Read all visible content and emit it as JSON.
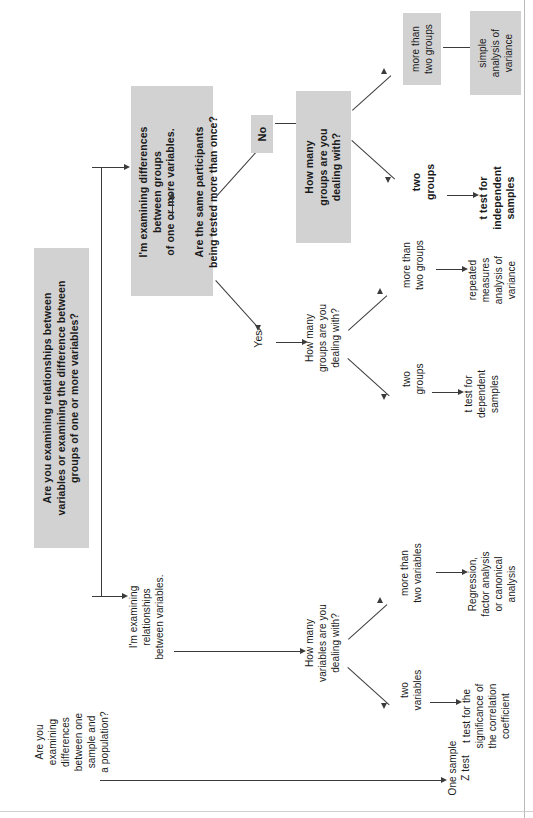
{
  "diagram": {
    "orientation": "rotated-90-ccw",
    "shade_color": "#d2d2d2",
    "line_color": "#3b3b3b",
    "nodes": {
      "root_question": "Are you examining relationships between\nvariables or examining the difference between\ngroups of one or more variables?",
      "branch_differences": "I'm examining differences\nbetween groups\nof one or more variables.",
      "repeat_question": "Are the same participants\nbeing tested more than once?",
      "answer_no": "No",
      "answer_yes": "Yes",
      "groups_question_bold": "How many\ngroups are you\ndealing with?",
      "groups_question_plain": "How many\ngroups are you\ndealing with?",
      "no_more_than_two": "more than\ntwo groups",
      "no_two_groups": "two\ngroups",
      "result_anova": "simple\nanalysis of\nvariance",
      "result_t_independent": "t test for\nindependent\nsamples",
      "yes_more_than_two": "more than\ntwo groups",
      "yes_two_groups": "two\ngroups",
      "result_repeated_anova": "repeated\nmeasures\nanalysis of\nvariance",
      "result_t_dependent": "t test for\ndependent\nsamples",
      "branch_relationships": "I'm examining\nrelationships\nbetween variables.",
      "variables_question": "How many\nvariables are you\ndealing with?",
      "vars_more_than_two": "more than\ntwo variables",
      "vars_two": "two\nvariables",
      "result_regression": "Regression,\nfactor analysis\nor canonical\nanalysis",
      "result_t_correlation": "t test for the\nsignificance of\nthe correlation\ncoefficient",
      "sample_question": "Are you\nexamining\ndifferences\nbetween one\nsample and\na population?",
      "result_one_sample_z": "One sample\nZ test"
    }
  }
}
